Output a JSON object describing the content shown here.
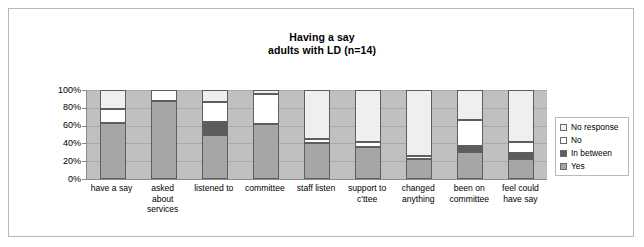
{
  "chart_data": {
    "type": "bar",
    "subtype": "stacked-100-percent",
    "title": "Having a say\nadults with LD (n=14)",
    "title_lines": [
      "Having a say",
      "adults with LD (n=14)"
    ],
    "xlabel": "",
    "ylabel": "",
    "ylim": [
      0,
      100
    ],
    "ytick_labels": [
      "100%",
      "80%",
      "60%",
      "40%",
      "20%",
      "0%"
    ],
    "ytick_values": [
      100,
      80,
      60,
      40,
      20,
      0
    ],
    "grid": true,
    "legend_position": "right",
    "categories": [
      "have a say",
      "asked about services",
      "listened to",
      "committee",
      "staff listen",
      "support to c'ttee",
      "changed anything",
      "been on committee",
      "feel could have say"
    ],
    "category_lines": [
      [
        "have a say"
      ],
      [
        "asked",
        "about",
        "services"
      ],
      [
        "listened to"
      ],
      [
        "committee"
      ],
      [
        "staff listen"
      ],
      [
        "support to",
        "c'ttee"
      ],
      [
        "changed",
        "anything"
      ],
      [
        "been on",
        "committee"
      ],
      [
        "feel could",
        "have say"
      ]
    ],
    "series": [
      {
        "name": "Yes",
        "color": "#a6a6a6",
        "values": [
          63,
          88,
          50,
          62,
          40,
          36,
          22,
          30,
          22
        ]
      },
      {
        "name": "In between",
        "color": "#5c5c5c",
        "values": [
          0,
          0,
          14,
          0,
          0,
          0,
          0,
          7,
          7
        ]
      },
      {
        "name": "No",
        "color": "#ffffff",
        "values": [
          16,
          12,
          22,
          34,
          5,
          6,
          4,
          29,
          13
        ]
      },
      {
        "name": "No response",
        "color": "#efefef",
        "values": [
          21,
          0,
          14,
          4,
          55,
          58,
          74,
          34,
          58
        ]
      }
    ],
    "legend_entries": [
      {
        "label": "No response",
        "color": "#efefef"
      },
      {
        "label": "No",
        "color": "#ffffff"
      },
      {
        "label": "In between",
        "color": "#5c5c5c"
      },
      {
        "label": "Yes",
        "color": "#a6a6a6"
      }
    ],
    "plot_background": "#c0c0c0"
  }
}
